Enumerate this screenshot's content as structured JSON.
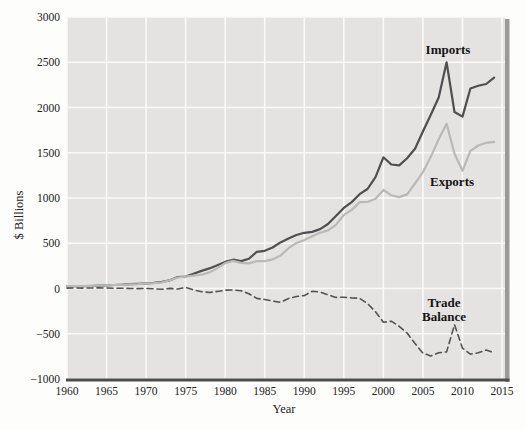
{
  "chart_data": {
    "type": "line",
    "title": "",
    "xlabel": "Year",
    "ylabel": "$ Billions",
    "xlim": [
      1960,
      2015
    ],
    "ylim": [
      -1000,
      3000
    ],
    "grid": true,
    "legend_position": "inline-annotations",
    "plot_background": "#e4e3e1",
    "gridline_color": "#faf9f7",
    "axis_line_color": "#4c4c4c",
    "frame_shadow_color": "#9a9a9a",
    "x_tick_labels": [
      "1960",
      "1965",
      "1970",
      "1975",
      "1980",
      "1985",
      "1990",
      "1995",
      "2000",
      "2005",
      "2010",
      "2015"
    ],
    "x_tick_values": [
      1960,
      1965,
      1970,
      1975,
      1980,
      1985,
      1990,
      1995,
      2000,
      2005,
      2010,
      2015
    ],
    "y_tick_labels": [
      "3000",
      "2500",
      "2000",
      "1500",
      "1000",
      "500",
      "0",
      "−500",
      "−1000"
    ],
    "y_tick_values": [
      3000,
      2500,
      2000,
      1500,
      1000,
      500,
      0,
      -500,
      -1000
    ],
    "years": [
      1960,
      1961,
      1962,
      1963,
      1964,
      1965,
      1966,
      1967,
      1968,
      1969,
      1970,
      1971,
      1972,
      1973,
      1974,
      1975,
      1976,
      1977,
      1978,
      1979,
      1980,
      1981,
      1982,
      1983,
      1984,
      1985,
      1986,
      1987,
      1988,
      1989,
      1990,
      1991,
      1992,
      1993,
      1994,
      1995,
      1996,
      1997,
      1998,
      1999,
      2000,
      2001,
      2002,
      2003,
      2004,
      2005,
      2006,
      2007,
      2008,
      2009,
      2010,
      2011,
      2012,
      2013,
      2014
    ],
    "series": [
      {
        "name": "Imports",
        "color": "#4e4e53",
        "style": "solid",
        "values": [
          25,
          25,
          27,
          28,
          31,
          33,
          39,
          42,
          48,
          52,
          57,
          62,
          74,
          91,
          127,
          133,
          162,
          194,
          222,
          257,
          294,
          318,
          303,
          328,
          405,
          417,
          453,
          509,
          554,
          591,
          616,
          625,
          656,
          713,
          801,
          891,
          955,
          1042,
          1099,
          1230,
          1450,
          1370,
          1360,
          1440,
          1545,
          1735,
          1920,
          2110,
          2500,
          1950,
          1900,
          2210,
          2240,
          2260,
          2330
        ]
      },
      {
        "name": "Exports",
        "color": "#b9b9b9",
        "style": "solid",
        "values": [
          27,
          27,
          28,
          30,
          33,
          35,
          39,
          41,
          46,
          49,
          57,
          60,
          67,
          91,
          121,
          133,
          143,
          152,
          178,
          224,
          281,
          305,
          283,
          277,
          302,
          303,
          321,
          364,
          445,
          503,
          535,
          578,
          616,
          642,
          703,
          812,
          868,
          955,
          956,
          991,
          1090,
          1030,
          1010,
          1040,
          1160,
          1285,
          1455,
          1650,
          1820,
          1490,
          1300,
          1520,
          1580,
          1610,
          1620
        ]
      },
      {
        "name": "Trade Balance",
        "color": "#525257",
        "style": "dashed",
        "values": [
          4,
          5,
          4,
          5,
          7,
          5,
          2,
          2,
          0,
          -1,
          1,
          -3,
          -8,
          1,
          -5,
          12,
          -15,
          -35,
          -44,
          -33,
          -19,
          -16,
          -24,
          -57,
          -109,
          -121,
          -139,
          -152,
          -110,
          -88,
          -78,
          -31,
          -39,
          -70,
          -98,
          -96,
          -104,
          -108,
          -166,
          -258,
          -372,
          -361,
          -418,
          -493,
          -609,
          -714,
          -745,
          -710,
          -700,
          -400,
          -660,
          -725,
          -710,
          -680,
          -710
        ]
      }
    ],
    "annotations": [
      {
        "text": "Imports"
      },
      {
        "text": "Exports"
      },
      {
        "text": "Trade"
      },
      {
        "text": "Balance"
      }
    ]
  }
}
